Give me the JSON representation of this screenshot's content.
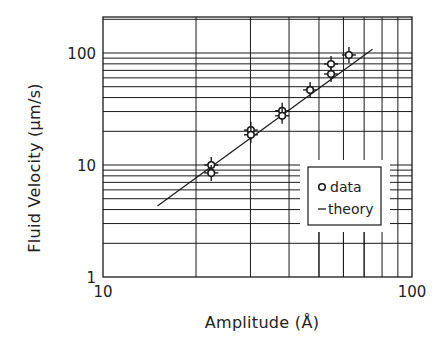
{
  "chart_data": {
    "type": "scatter",
    "title": "",
    "xlabel": "Amplitude (Å)",
    "ylabel": "Fluid Velocity (μm/s)",
    "xscale": "log",
    "yscale": "log",
    "xlim": [
      10,
      100
    ],
    "ylim": [
      1,
      210
    ],
    "x_ticks": [
      {
        "value": 10,
        "label": "10"
      },
      {
        "value": 100,
        "label": "100"
      }
    ],
    "y_ticks": [
      {
        "value": 1,
        "label": "1"
      },
      {
        "value": 10,
        "label": "10"
      },
      {
        "value": 100,
        "label": "100"
      }
    ],
    "grid": true,
    "legend": {
      "position": "lower right (inside)",
      "entries": [
        {
          "marker": "o",
          "label": "data"
        },
        {
          "marker": "-",
          "label": "theory"
        }
      ]
    },
    "series": [
      {
        "name": "data",
        "kind": "points_with_error_bars",
        "points": [
          {
            "x": 22.4,
            "y": 10.0
          },
          {
            "x": 22.4,
            "y": 8.5
          },
          {
            "x": 30.1,
            "y": 20.5
          },
          {
            "x": 30.1,
            "y": 18.6
          },
          {
            "x": 38.0,
            "y": 30.5
          },
          {
            "x": 38.0,
            "y": 27.5
          },
          {
            "x": 46.8,
            "y": 46.8
          },
          {
            "x": 54.7,
            "y": 79.8
          },
          {
            "x": 54.7,
            "y": 64.9
          },
          {
            "x": 62.5,
            "y": 96.0
          }
        ]
      },
      {
        "name": "theory",
        "kind": "line",
        "x": [
          15.0,
          74.5
        ],
        "y": [
          4.3,
          108
        ]
      }
    ]
  }
}
